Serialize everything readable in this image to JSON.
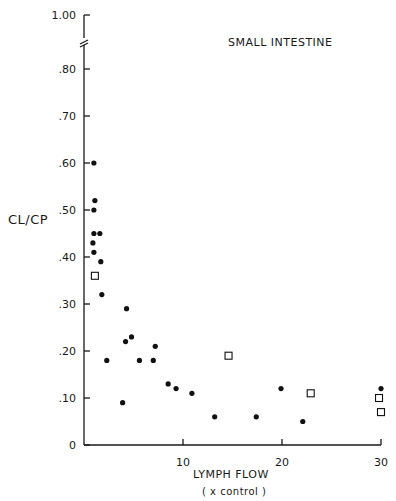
{
  "chart_data": {
    "type": "scatter",
    "title": "SMALL INTESTINE",
    "xlabel": "LYMPH FLOW",
    "xlabel_sub": "( x control )",
    "ylabel": "CL/CP",
    "xlim": [
      0,
      30
    ],
    "ylim": [
      0,
      1.0
    ],
    "y_axis_break": [
      0.85,
      0.98
    ],
    "xticks": [
      0,
      10,
      20,
      30
    ],
    "xtick_labels": [
      "",
      "10",
      "20",
      "30"
    ],
    "yticks": [
      0,
      0.1,
      0.2,
      0.3,
      0.4,
      0.5,
      0.6,
      0.7,
      0.8,
      1.0
    ],
    "ytick_labels": [
      "0",
      ".10",
      ".20",
      ".30",
      ".40",
      ".50",
      ".60",
      ".70",
      ".80",
      "1.00"
    ],
    "grid": false,
    "series": [
      {
        "name": "filled circles",
        "marker": "filled-circle",
        "points": [
          [
            1.0,
            0.6
          ],
          [
            1.1,
            0.52
          ],
          [
            1.0,
            0.5
          ],
          [
            1.0,
            0.45
          ],
          [
            1.6,
            0.45
          ],
          [
            0.9,
            0.43
          ],
          [
            1.0,
            0.41
          ],
          [
            1.7,
            0.39
          ],
          [
            1.8,
            0.32
          ],
          [
            2.3,
            0.18
          ],
          [
            4.3,
            0.29
          ],
          [
            4.2,
            0.22
          ],
          [
            4.8,
            0.23
          ],
          [
            5.6,
            0.18
          ],
          [
            7.0,
            0.18
          ],
          [
            7.2,
            0.21
          ],
          [
            3.9,
            0.09
          ],
          [
            8.5,
            0.13
          ],
          [
            9.3,
            0.12
          ],
          [
            10.9,
            0.11
          ],
          [
            13.2,
            0.06
          ],
          [
            17.4,
            0.06
          ],
          [
            19.9,
            0.12
          ],
          [
            22.1,
            0.05
          ],
          [
            30.0,
            0.12
          ]
        ]
      },
      {
        "name": "open squares",
        "marker": "open-square",
        "points": [
          [
            1.1,
            0.36
          ],
          [
            14.6,
            0.19
          ],
          [
            22.9,
            0.11
          ],
          [
            29.8,
            0.1
          ],
          [
            30.0,
            0.07
          ]
        ]
      }
    ]
  }
}
